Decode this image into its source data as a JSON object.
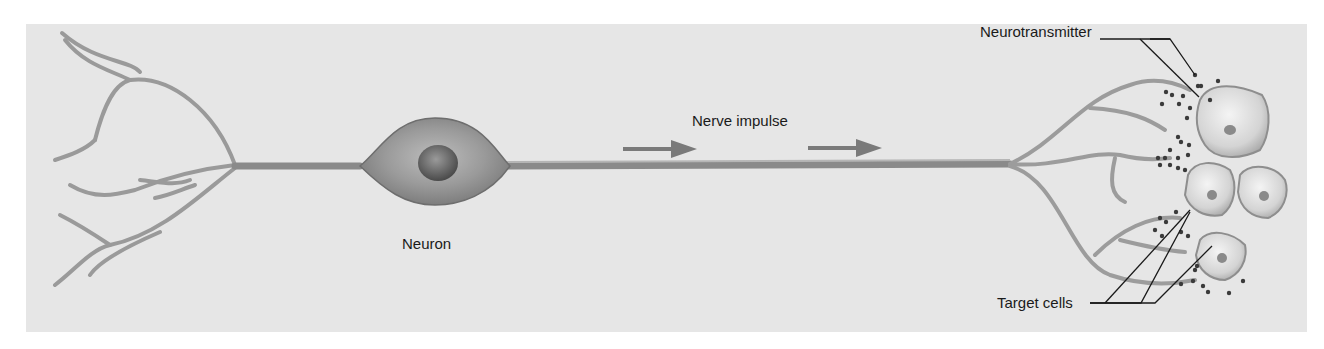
{
  "figure": {
    "labels": {
      "neurotransmitter": "Neurotransmitter",
      "nerve_impulse": "Nerve impulse",
      "neuron": "Neuron",
      "target_cells": "Target cells"
    },
    "colors": {
      "background": "#ffffff",
      "panel": "#e6e6e6",
      "axon": "#8a8a8a",
      "arrow": "#7a7a7a",
      "leader_line": "#1a1a1a",
      "vesicle": "#3a3a3a"
    }
  }
}
